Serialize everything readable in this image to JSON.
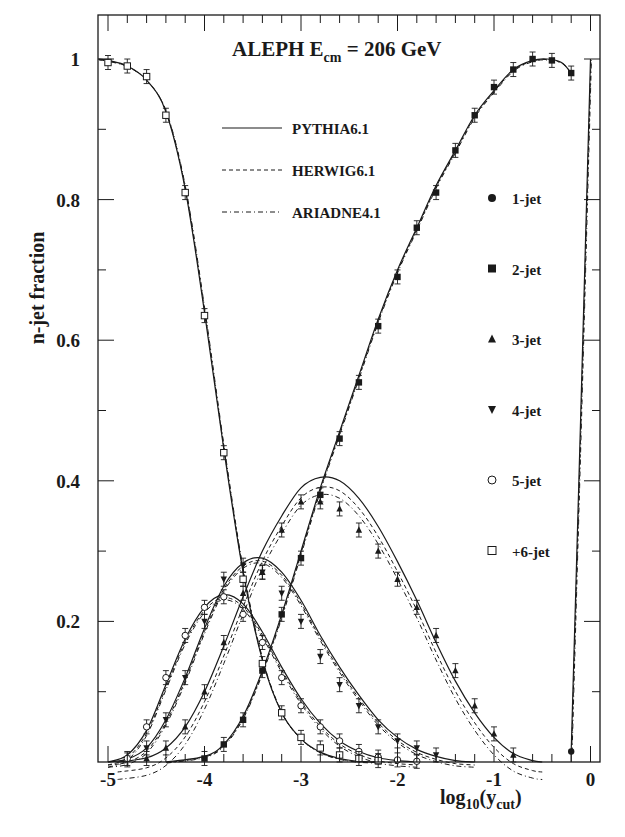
{
  "chart_data": {
    "type": "line",
    "title_parts": {
      "main": "ALEPH  E",
      "sub": "cm",
      "rest": " = 206 GeV"
    },
    "xlabel": "log10(y_cut)",
    "xlabel_parts": {
      "a": "log",
      "sub1": "10",
      "b": "(y",
      "sub2": "cut",
      "c": ")"
    },
    "ylabel": "n-jet fraction",
    "xlim": [
      -5.1,
      0.1
    ],
    "ylim": [
      0,
      1.05
    ],
    "x_ticks": [
      -5,
      -4,
      -3,
      -2,
      -1,
      0
    ],
    "x_tick_labels": [
      "-5",
      "-4",
      "-3",
      "-2",
      "-1",
      "0"
    ],
    "y_ticks": [
      0.2,
      0.4,
      0.6,
      0.8,
      1
    ],
    "y_tick_labels": [
      "0.2",
      "0.4",
      "0.6",
      "0.8",
      "1"
    ],
    "grid": false,
    "models": [
      {
        "name": "PYTHIA6.1",
        "style": "solid"
      },
      {
        "name": "HERWIG6.1",
        "style": "dashed"
      },
      {
        "name": "ARIADNE4.1",
        "style": "dash-dot"
      }
    ],
    "series": [
      {
        "name": "1-jet",
        "marker": "filled-circle",
        "points": [
          [
            -0.2,
            0.015
          ]
        ],
        "curve": [
          [
            -0.2,
            0.015
          ],
          [
            -0.1,
            0.5
          ],
          [
            -0.05,
            0.75
          ],
          [
            0.0,
            1.0
          ]
        ]
      },
      {
        "name": "2-jet",
        "marker": "filled-square",
        "points": [
          [
            -4.0,
            0.005
          ],
          [
            -3.8,
            0.025
          ],
          [
            -3.6,
            0.06
          ],
          [
            -3.4,
            0.13
          ],
          [
            -3.2,
            0.21
          ],
          [
            -3.0,
            0.29
          ],
          [
            -2.8,
            0.38
          ],
          [
            -2.6,
            0.46
          ],
          [
            -2.4,
            0.54
          ],
          [
            -2.2,
            0.62
          ],
          [
            -2.0,
            0.69
          ],
          [
            -1.8,
            0.76
          ],
          [
            -1.6,
            0.81
          ],
          [
            -1.4,
            0.87
          ],
          [
            -1.2,
            0.92
          ],
          [
            -1.0,
            0.96
          ],
          [
            -0.8,
            0.985
          ],
          [
            -0.6,
            1.0
          ],
          [
            -0.4,
            0.998
          ],
          [
            -0.2,
            0.98
          ]
        ],
        "curve": [
          [
            -4.4,
            0.0
          ],
          [
            -4.0,
            0.008
          ],
          [
            -3.8,
            0.025
          ],
          [
            -3.6,
            0.065
          ],
          [
            -3.4,
            0.13
          ],
          [
            -3.2,
            0.21
          ],
          [
            -3.0,
            0.3
          ],
          [
            -2.8,
            0.39
          ],
          [
            -2.6,
            0.47
          ],
          [
            -2.4,
            0.55
          ],
          [
            -2.2,
            0.63
          ],
          [
            -2.0,
            0.7
          ],
          [
            -1.8,
            0.76
          ],
          [
            -1.6,
            0.82
          ],
          [
            -1.4,
            0.87
          ],
          [
            -1.2,
            0.92
          ],
          [
            -1.0,
            0.955
          ],
          [
            -0.8,
            0.985
          ],
          [
            -0.6,
            0.998
          ],
          [
            -0.45,
            1.0
          ],
          [
            -0.3,
            0.995
          ],
          [
            -0.2,
            0.98
          ]
        ]
      },
      {
        "name": "3-jet",
        "marker": "filled-triangle-up",
        "points": [
          [
            -4.6,
            0.005
          ],
          [
            -4.4,
            0.02
          ],
          [
            -4.2,
            0.05
          ],
          [
            -4.0,
            0.1
          ],
          [
            -3.8,
            0.17
          ],
          [
            -3.6,
            0.24
          ],
          [
            -3.4,
            0.27
          ],
          [
            -3.2,
            0.33
          ],
          [
            -3.0,
            0.37
          ],
          [
            -2.8,
            0.37
          ],
          [
            -2.6,
            0.36
          ],
          [
            -2.4,
            0.33
          ],
          [
            -2.2,
            0.3
          ],
          [
            -2.0,
            0.26
          ],
          [
            -1.8,
            0.22
          ],
          [
            -1.6,
            0.18
          ],
          [
            -1.4,
            0.13
          ],
          [
            -1.2,
            0.08
          ],
          [
            -1.0,
            0.04
          ],
          [
            -0.8,
            0.01
          ]
        ],
        "curve": [
          [
            -4.9,
            0.0
          ],
          [
            -4.6,
            0.006
          ],
          [
            -4.4,
            0.02
          ],
          [
            -4.2,
            0.05
          ],
          [
            -4.0,
            0.1
          ],
          [
            -3.8,
            0.165
          ],
          [
            -3.6,
            0.235
          ],
          [
            -3.4,
            0.3
          ],
          [
            -3.2,
            0.35
          ],
          [
            -3.0,
            0.39
          ],
          [
            -2.8,
            0.405
          ],
          [
            -2.6,
            0.4
          ],
          [
            -2.4,
            0.375
          ],
          [
            -2.2,
            0.335
          ],
          [
            -2.0,
            0.285
          ],
          [
            -1.8,
            0.23
          ],
          [
            -1.6,
            0.17
          ],
          [
            -1.4,
            0.115
          ],
          [
            -1.2,
            0.07
          ],
          [
            -1.0,
            0.035
          ],
          [
            -0.8,
            0.012
          ],
          [
            -0.6,
            0.002
          ],
          [
            -0.5,
            0.0
          ]
        ]
      },
      {
        "name": "4-jet",
        "marker": "filled-triangle-down",
        "points": [
          [
            -4.8,
            0.003
          ],
          [
            -4.6,
            0.02
          ],
          [
            -4.4,
            0.06
          ],
          [
            -4.2,
            0.12
          ],
          [
            -4.0,
            0.2
          ],
          [
            -3.8,
            0.26
          ],
          [
            -3.6,
            0.28
          ],
          [
            -3.4,
            0.27
          ],
          [
            -3.2,
            0.24
          ],
          [
            -3.0,
            0.2
          ],
          [
            -2.8,
            0.15
          ],
          [
            -2.6,
            0.11
          ],
          [
            -2.4,
            0.08
          ],
          [
            -2.2,
            0.05
          ],
          [
            -2.0,
            0.03
          ],
          [
            -1.8,
            0.02
          ],
          [
            -1.6,
            0.01
          ]
        ],
        "curve": [
          [
            -5.0,
            0.0
          ],
          [
            -4.8,
            0.004
          ],
          [
            -4.6,
            0.02
          ],
          [
            -4.4,
            0.06
          ],
          [
            -4.2,
            0.12
          ],
          [
            -4.0,
            0.19
          ],
          [
            -3.8,
            0.25
          ],
          [
            -3.6,
            0.283
          ],
          [
            -3.4,
            0.29
          ],
          [
            -3.2,
            0.27
          ],
          [
            -3.0,
            0.23
          ],
          [
            -2.8,
            0.18
          ],
          [
            -2.6,
            0.135
          ],
          [
            -2.4,
            0.095
          ],
          [
            -2.2,
            0.06
          ],
          [
            -2.0,
            0.035
          ],
          [
            -1.8,
            0.018
          ],
          [
            -1.6,
            0.008
          ],
          [
            -1.4,
            0.002
          ],
          [
            -1.2,
            0.0
          ]
        ]
      },
      {
        "name": "5-jet",
        "marker": "open-circle",
        "points": [
          [
            -4.8,
            0.005
          ],
          [
            -4.6,
            0.05
          ],
          [
            -4.4,
            0.12
          ],
          [
            -4.2,
            0.18
          ],
          [
            -4.0,
            0.22
          ],
          [
            -3.8,
            0.235
          ],
          [
            -3.6,
            0.21
          ],
          [
            -3.4,
            0.17
          ],
          [
            -3.2,
            0.12
          ],
          [
            -3.0,
            0.08
          ],
          [
            -2.8,
            0.05
          ],
          [
            -2.6,
            0.03
          ],
          [
            -2.4,
            0.015
          ],
          [
            -2.2,
            0.007
          ],
          [
            -2.0,
            0.003
          ],
          [
            -1.8,
            0.001
          ]
        ],
        "curve": [
          [
            -5.0,
            0.0
          ],
          [
            -4.8,
            0.01
          ],
          [
            -4.6,
            0.045
          ],
          [
            -4.4,
            0.11
          ],
          [
            -4.2,
            0.175
          ],
          [
            -4.0,
            0.22
          ],
          [
            -3.8,
            0.238
          ],
          [
            -3.6,
            0.225
          ],
          [
            -3.4,
            0.185
          ],
          [
            -3.2,
            0.135
          ],
          [
            -3.0,
            0.09
          ],
          [
            -2.8,
            0.055
          ],
          [
            -2.6,
            0.03
          ],
          [
            -2.4,
            0.015
          ],
          [
            -2.2,
            0.006
          ],
          [
            -2.0,
            0.002
          ],
          [
            -1.8,
            0.0
          ]
        ]
      },
      {
        "name": "+6-jet",
        "marker": "open-square",
        "points": [
          [
            -5.0,
            0.995
          ],
          [
            -4.8,
            0.99
          ],
          [
            -4.6,
            0.975
          ],
          [
            -4.4,
            0.92
          ],
          [
            -4.2,
            0.81
          ],
          [
            -4.0,
            0.635
          ],
          [
            -3.8,
            0.44
          ],
          [
            -3.6,
            0.26
          ],
          [
            -3.4,
            0.14
          ],
          [
            -3.2,
            0.07
          ],
          [
            -3.0,
            0.035
          ],
          [
            -2.8,
            0.02
          ],
          [
            -2.6,
            0.01
          ],
          [
            -2.4,
            0.005
          ],
          [
            -2.2,
            0.002
          ]
        ],
        "curve": [
          [
            -5.1,
            1.0
          ],
          [
            -5.0,
            0.998
          ],
          [
            -4.8,
            0.99
          ],
          [
            -4.6,
            0.97
          ],
          [
            -4.4,
            0.925
          ],
          [
            -4.2,
            0.815
          ],
          [
            -4.0,
            0.64
          ],
          [
            -3.8,
            0.445
          ],
          [
            -3.6,
            0.27
          ],
          [
            -3.4,
            0.145
          ],
          [
            -3.2,
            0.07
          ],
          [
            -3.0,
            0.033
          ],
          [
            -2.8,
            0.014
          ],
          [
            -2.6,
            0.005
          ],
          [
            -2.4,
            0.001
          ],
          [
            -2.2,
            0.0
          ]
        ]
      }
    ],
    "legend": {
      "models": [
        "PYTHIA6.1",
        "HERWIG6.1",
        "ARIADNE4.1"
      ],
      "markers": [
        "1-jet",
        "2-jet",
        "3-jet",
        "4-jet",
        "5-jet",
        "+6-jet"
      ],
      "position": "inside-right"
    }
  },
  "colors": {
    "ink": "#1a1a1a",
    "background": "#ffffff"
  }
}
